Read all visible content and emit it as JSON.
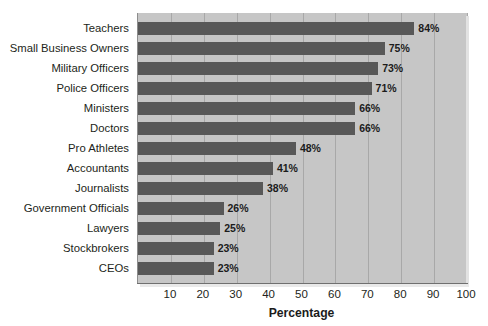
{
  "chart_data": {
    "type": "bar",
    "orientation": "horizontal",
    "title": "",
    "xlabel": "Percentage",
    "ylabel": "",
    "xlim": [
      0,
      100
    ],
    "xticks": [
      10,
      20,
      30,
      40,
      50,
      60,
      70,
      80,
      90,
      100
    ],
    "grid": true,
    "legend": false,
    "bar_color": "#585858",
    "plot_background": "#c6c6c6",
    "value_suffix": "%",
    "categories": [
      "Teachers",
      "Small Business Owners",
      "Military Officers",
      "Police Officers",
      "Ministers",
      "Doctors",
      "Pro Athletes",
      "Accountants",
      "Journalists",
      "Government Officials",
      "Lawyers",
      "Stockbrokers",
      "CEOs"
    ],
    "values": [
      84,
      75,
      73,
      71,
      66,
      66,
      48,
      41,
      38,
      26,
      25,
      23,
      23
    ],
    "data_labels": [
      "84%",
      "75%",
      "73%",
      "71%",
      "66%",
      "66%",
      "48%",
      "41%",
      "38%",
      "26%",
      "25%",
      "23%",
      "23%"
    ]
  }
}
